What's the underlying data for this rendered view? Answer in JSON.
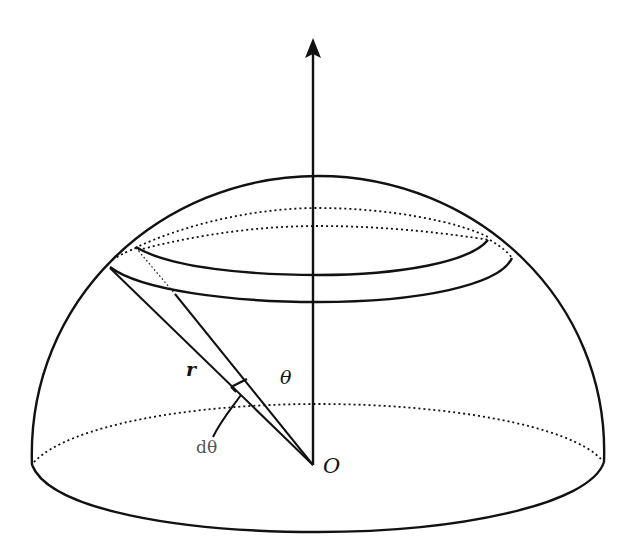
{
  "diagram": {
    "type": "hemisphere-geometry",
    "labels": {
      "radius": "r",
      "angle": "θ",
      "angle_increment": "dθ",
      "origin": "O"
    },
    "colors": {
      "stroke": "#111111",
      "label_gray": "#555555",
      "background": "#ffffff"
    }
  }
}
